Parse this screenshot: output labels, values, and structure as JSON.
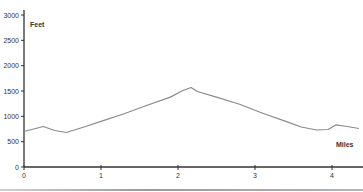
{
  "chart_data": {
    "type": "line",
    "title": "",
    "xlabel": "Miles",
    "ylabel": "Feet",
    "xlim": [
      0,
      4.35
    ],
    "ylim": [
      0,
      3000
    ],
    "grid": false,
    "legend": null,
    "x_ticks": [
      "0",
      "1",
      "2",
      "3",
      "4"
    ],
    "y_ticks": [
      "0",
      "500",
      "1000",
      "1500",
      "2000",
      "2500",
      "3000"
    ],
    "line_color": "#8a8a8a",
    "axis_color": "#333333",
    "series": [
      {
        "name": "Elevation",
        "x": [
          0,
          0.25,
          0.4,
          0.55,
          0.8,
          1.0,
          1.3,
          1.6,
          1.9,
          2.05,
          2.17,
          2.25,
          2.5,
          2.8,
          3.1,
          3.4,
          3.6,
          3.8,
          3.95,
          4.05,
          4.2,
          4.35
        ],
        "values": [
          700,
          800,
          720,
          680,
          800,
          900,
          1050,
          1220,
          1380,
          1500,
          1570,
          1490,
          1380,
          1240,
          1060,
          900,
          790,
          730,
          740,
          830,
          800,
          760
        ]
      }
    ]
  }
}
